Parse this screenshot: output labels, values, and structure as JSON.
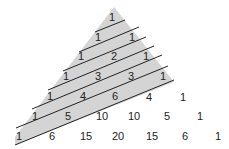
{
  "diagram": {
    "colors": {
      "shade": "#d4d4d4",
      "line": "#222222",
      "text": "#222222",
      "background": "#ffffff"
    },
    "rows": [
      [
        "1"
      ],
      [
        "1",
        "1"
      ],
      [
        "1",
        "2",
        "1"
      ],
      [
        "1",
        "3",
        "3",
        "1"
      ],
      [
        "1",
        "4",
        "6",
        "4",
        "1"
      ],
      [
        "1",
        "5",
        "10",
        "10",
        "5",
        "1"
      ],
      [
        "1",
        "6",
        "15",
        "20",
        "15",
        "6",
        "1"
      ]
    ]
  }
}
